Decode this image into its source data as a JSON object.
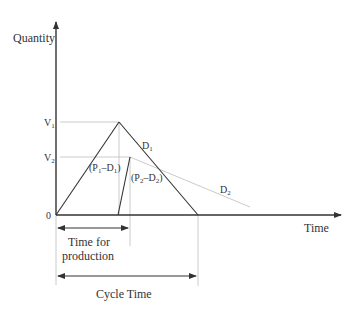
{
  "diagram": {
    "axes": {
      "y_label": "Quantity",
      "x_label": "Time",
      "origin_label": "0"
    },
    "levels": [
      {
        "name": "V",
        "sub": "1",
        "key": "V1"
      },
      {
        "name": "V",
        "sub": "2",
        "key": "V2"
      }
    ],
    "segments": {
      "rate1": {
        "open": "(P",
        "sub1": "1",
        "mid": "–D",
        "sub2": "1",
        "close": ")"
      },
      "rate2": {
        "open": "(P",
        "sub1": "2",
        "mid": "–D",
        "sub2": "2",
        "close": ")"
      },
      "d1": {
        "name": "D",
        "sub": "1"
      },
      "d2": {
        "name": "D",
        "sub": "2"
      }
    },
    "spans": {
      "production_line1": "Time for",
      "production_line2": "production",
      "cycle": "Cycle Time"
    },
    "colors": {
      "main_line": "#333333",
      "guide_line": "#bbbbbb"
    }
  }
}
